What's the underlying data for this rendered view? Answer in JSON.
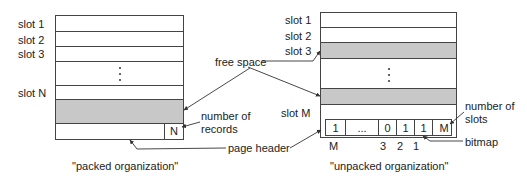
{
  "packed": {
    "slot_labels": [
      "slot 1",
      "slot 2",
      "slot 3",
      "slot N"
    ],
    "count_value": "N",
    "caption": "\"packed organization\""
  },
  "unpacked": {
    "slot_labels": [
      "slot 1",
      "slot 2",
      "slot 3",
      "slot M"
    ],
    "bitmap_cells": [
      "1",
      "...",
      "0",
      "1",
      "1"
    ],
    "count_value": "M",
    "bitmap_indices": [
      "M",
      "3",
      "2",
      "1"
    ],
    "caption": "\"unpacked organization\""
  },
  "annotations": {
    "free_space": "free space",
    "number_of_records_line1": "number of",
    "number_of_records_line2": "records",
    "page_header": "page header",
    "number_of_slots_line1": "number of",
    "number_of_slots_line2": "slots",
    "bitmap": "bitmap"
  },
  "colors": {
    "free_space_fill": "#c8c8c8",
    "line": "#444444"
  }
}
